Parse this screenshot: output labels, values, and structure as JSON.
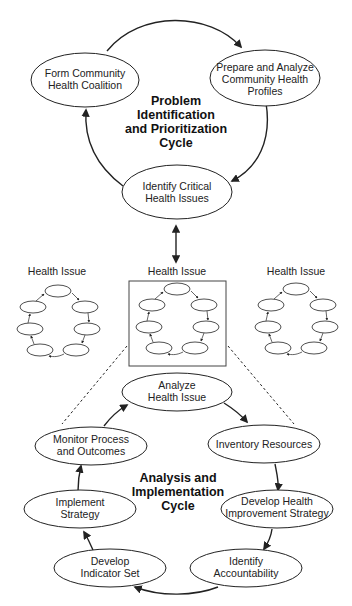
{
  "diagram": {
    "top_cycle": {
      "title_lines": [
        "Problem",
        "Identification",
        "and Prioritization",
        "Cycle"
      ],
      "nodes": [
        {
          "lines": [
            "Form Community",
            "Health Coalition"
          ]
        },
        {
          "lines": [
            "Prepare and Analyze",
            "Community Health",
            "Profiles"
          ]
        },
        {
          "lines": [
            "Identify Critical",
            "Health Issues"
          ]
        }
      ]
    },
    "health_issues": [
      {
        "label": "Health Issue",
        "highlighted": false
      },
      {
        "label": "Health Issue",
        "highlighted": true
      },
      {
        "label": "Health Issue",
        "highlighted": false
      }
    ],
    "bottom_cycle": {
      "title_lines": [
        "Analysis and",
        "Implementation",
        "Cycle"
      ],
      "nodes": [
        {
          "lines": [
            "Analyze",
            "Health Issue"
          ]
        },
        {
          "lines": [
            "Inventory Resources"
          ]
        },
        {
          "lines": [
            "Develop Health",
            "Improvement Strategy"
          ]
        },
        {
          "lines": [
            "Identify",
            "Accountability"
          ]
        },
        {
          "lines": [
            "Develop",
            "Indicator Set"
          ]
        },
        {
          "lines": [
            "Implement",
            "Strategy"
          ]
        },
        {
          "lines": [
            "Monitor Process",
            "and Outcomes"
          ]
        }
      ]
    },
    "colors": {
      "stroke": "#222222",
      "background": "#ffffff"
    }
  }
}
